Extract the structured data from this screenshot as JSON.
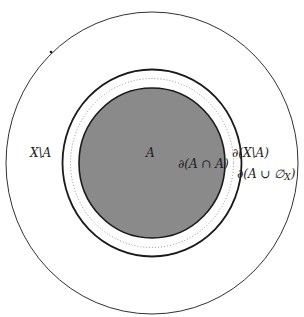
{
  "diagram": {
    "colors": {
      "fill_A": "#8a8a8a",
      "stroke": "#1a1a1a",
      "background": "#ffffff"
    },
    "regions": {
      "outer": {
        "cx": 152,
        "cy": 163,
        "rx": 146,
        "ry": 151,
        "style": "thin"
      },
      "closure_outer": {
        "cx": 152,
        "cy": 163,
        "rx": 89.5,
        "ry": 93.5,
        "style": "thick"
      },
      "dotted": {
        "cx": 152,
        "cy": 163,
        "rx": 81.5,
        "ry": 84.5,
        "style": "dotted"
      },
      "set_A": {
        "cx": 152,
        "cy": 163,
        "rx": 73,
        "ry": 75,
        "style": "filled"
      }
    },
    "labels": {
      "complement": "X\\A",
      "set_a": "A",
      "boundary_a_cap_a": "∂(A ∩ A)",
      "boundary_complement": "∂(X\\A)",
      "boundary_a_cup_empty": "∂(A ∪ ∅",
      "boundary_subscript": "X",
      "boundary_close": ")"
    }
  }
}
